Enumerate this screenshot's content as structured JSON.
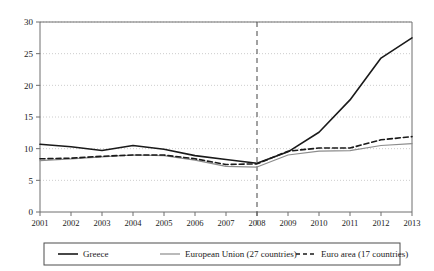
{
  "chart_data": {
    "type": "line",
    "title": "",
    "subtitle": "",
    "xlabel": "",
    "ylabel": "",
    "x": [
      2001,
      2002,
      2003,
      2004,
      2005,
      2006,
      2007,
      2008,
      2009,
      2010,
      2011,
      2012,
      2013
    ],
    "categories": [
      "2001",
      "2002",
      "2003",
      "2004",
      "2005",
      "2006",
      "2007",
      "2008",
      "2009",
      "2010",
      "2011",
      "2012",
      "2013"
    ],
    "xlim": [
      2001,
      2013
    ],
    "ylim": [
      0,
      30
    ],
    "yticks": [
      0,
      5,
      10,
      15,
      20,
      25,
      30
    ],
    "ytick_labels": [
      "0",
      "5",
      "10",
      "15",
      "20",
      "25",
      "30"
    ],
    "grid": true,
    "grid_style": "dotted-horizontal",
    "legend_position": "bottom",
    "series": [
      {
        "name": "Greece",
        "style": "solid",
        "color": "#1a1a1a",
        "width": 1.6,
        "values": [
          10.7,
          10.3,
          9.7,
          10.5,
          9.9,
          8.9,
          8.3,
          7.7,
          9.5,
          12.6,
          17.7,
          24.3,
          27.5
        ]
      },
      {
        "name": "European Union (27 countries)",
        "style": "solid",
        "color": "#8c8c8c",
        "width": 1.2,
        "values": [
          8.1,
          8.4,
          8.7,
          9.0,
          8.9,
          8.2,
          7.2,
          7.1,
          9.0,
          9.6,
          9.7,
          10.5,
          10.8
        ]
      },
      {
        "name": "Euro area (17 countries)",
        "style": "dashed",
        "color": "#1a1a1a",
        "width": 1.6,
        "values": [
          8.4,
          8.5,
          8.8,
          9.0,
          9.0,
          8.4,
          7.5,
          7.6,
          9.6,
          10.1,
          10.1,
          11.4,
          11.9
        ]
      }
    ],
    "annotations": [
      {
        "name": "crisis-marker",
        "type": "vertical-line",
        "x": 2008,
        "style": "dashed",
        "color": "#555555"
      }
    ]
  },
  "legend": {
    "items": [
      {
        "label": "Greece",
        "swatch": "solid-black-line"
      },
      {
        "label": "European Union (27 countries)",
        "swatch": "solid-gray-line"
      },
      {
        "label": "Euro area (17 countries)",
        "swatch": "dashed-black-line"
      }
    ]
  },
  "colors": {
    "greece": "#1a1a1a",
    "eu27": "#8c8c8c",
    "euro17": "#1a1a1a",
    "axis": "#6e6e6e",
    "grid": "#bfbfbf",
    "marker": "#555555",
    "background": "#ffffff"
  }
}
